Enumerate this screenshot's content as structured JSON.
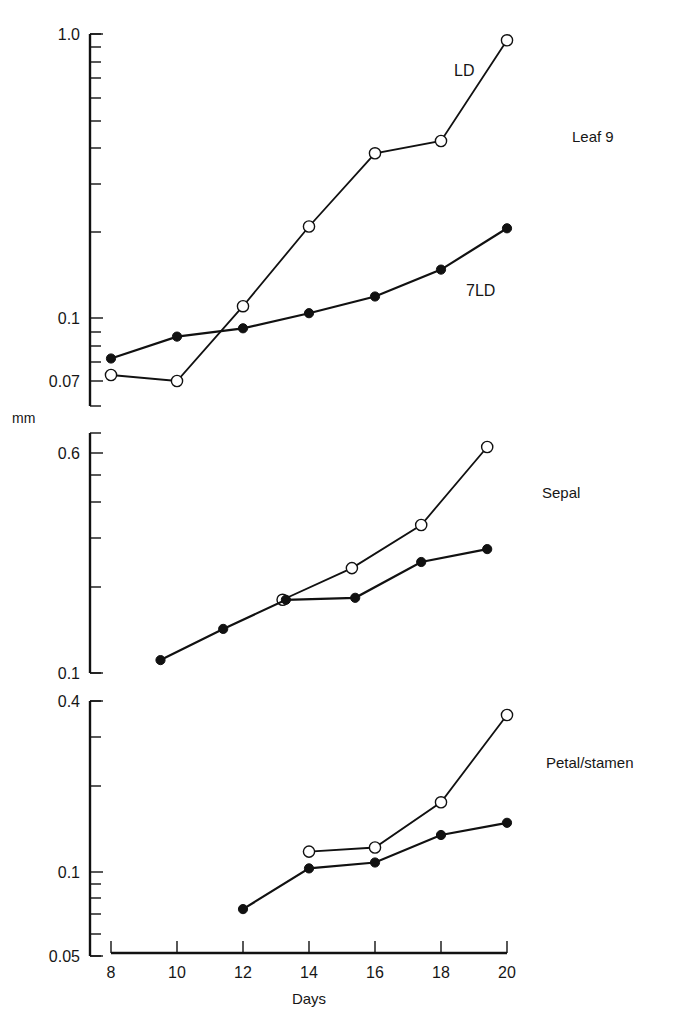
{
  "figure": {
    "y_unit_label": "mm",
    "x_label": "Days",
    "x_ticks": [
      8,
      10,
      12,
      14,
      16,
      18,
      20
    ],
    "colors": {
      "ink": "#111111",
      "background": "#ffffff"
    }
  },
  "chart_data": [
    {
      "type": "line",
      "title": "Leaf 9",
      "xlabel": "Days",
      "ylabel": "mm",
      "yscale": "log",
      "ylim": [
        0.06,
        1.0
      ],
      "ytick_labels": [
        "1.0",
        "0.1",
        "0.07"
      ],
      "annotations": [
        "LD",
        "7LD"
      ],
      "grid": false,
      "series": [
        {
          "name": "LD",
          "marker": "open-circle",
          "x": [
            8,
            10,
            12,
            14,
            16,
            18,
            20
          ],
          "values": [
            0.063,
            0.06,
            0.11,
            0.21,
            0.38,
            0.42,
            0.95
          ]
        },
        {
          "name": "7LD",
          "marker": "filled-circle",
          "x": [
            8,
            10,
            12,
            14,
            16,
            18,
            20
          ],
          "values": [
            0.072,
            0.086,
            0.092,
            0.104,
            0.119,
            0.148,
            0.207
          ]
        }
      ]
    },
    {
      "type": "line",
      "title": "Sepal",
      "xlabel": "Days",
      "ylabel": "mm",
      "yscale": "log",
      "ylim": [
        0.1,
        0.7
      ],
      "ytick_labels": [
        "0.6",
        "0.1"
      ],
      "grid": false,
      "series": [
        {
          "name": "LD",
          "marker": "open-circle",
          "x": [
            13.2,
            15.3,
            17.4,
            19.4
          ],
          "values": [
            0.181,
            0.234,
            0.332,
            0.625
          ]
        },
        {
          "name": "7LD",
          "marker": "filled-circle",
          "x": [
            9.5,
            11.4,
            13.3,
            15.4,
            17.4,
            19.4
          ],
          "values": [
            0.111,
            0.143,
            0.181,
            0.184,
            0.246,
            0.273
          ]
        }
      ]
    },
    {
      "type": "line",
      "title": "Petal/stamen",
      "xlabel": "Days",
      "ylabel": "mm",
      "yscale": "log",
      "ylim": [
        0.05,
        0.4
      ],
      "ytick_labels": [
        "0.4",
        "0.1",
        "0.05"
      ],
      "grid": false,
      "series": [
        {
          "name": "LD",
          "marker": "open-circle",
          "x": [
            14,
            16,
            18,
            20
          ],
          "values": [
            0.118,
            0.122,
            0.176,
            0.357
          ]
        },
        {
          "name": "7LD",
          "marker": "filled-circle",
          "x": [
            12,
            14,
            16,
            18,
            20
          ],
          "values": [
            0.074,
            0.103,
            0.108,
            0.135,
            0.149
          ]
        }
      ]
    }
  ],
  "layout": {
    "x_origin_px": 111,
    "x_px_per_day": 33.0,
    "px_per_decade": 284,
    "axis_x_px": 90,
    "panels": [
      {
        "ref_value": 0.1,
        "ref_px": 318,
        "axis_top_px": 34,
        "axis_bottom_px": 406,
        "labeled_ticks": [
          {
            "label": "1.0",
            "px": 34
          },
          {
            "label": "0.1",
            "px": 318
          },
          {
            "label": "0.07",
            "px": 381
          }
        ],
        "minor_ticks_px": [
          47,
          62,
          78,
          98,
          121,
          148,
          184,
          232,
          332,
          346,
          362
        ],
        "title_pos": [
          572,
          142
        ],
        "series_label_pos": {
          "LD": [
            454,
            76
          ],
          "7LD": [
            466,
            296
          ]
        }
      },
      {
        "ref_value": 0.1,
        "ref_px": 673,
        "axis_top_px": 433,
        "axis_bottom_px": 673,
        "labeled_ticks": [
          {
            "label": "0.6",
            "px": 453
          },
          {
            "label": "0.1",
            "px": 673
          }
        ],
        "minor_ticks_px": [
          475,
          502,
          538,
          587
        ],
        "title_pos": [
          542,
          498
        ]
      },
      {
        "ref_value": 0.1,
        "ref_px": 872,
        "axis_top_px": 701,
        "axis_bottom_px": 956,
        "labeled_ticks": [
          {
            "label": "0.4",
            "px": 701
          },
          {
            "label": "0.1",
            "px": 872
          },
          {
            "label": "0.05",
            "px": 956
          }
        ],
        "minor_ticks_px": [
          737,
          786,
          884,
          898,
          914,
          934
        ],
        "title_pos": [
          546,
          768
        ]
      }
    ],
    "x_axis_px": 953
  }
}
